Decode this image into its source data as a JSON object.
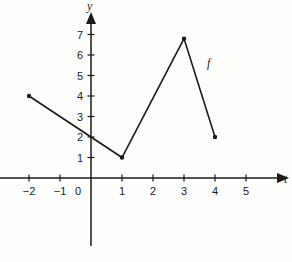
{
  "chart_data": {
    "type": "line",
    "title": "",
    "xlabel": "t",
    "ylabel": "y",
    "function_label": "f",
    "xlim": [
      -3,
      6
    ],
    "ylim": [
      -3.3,
      8
    ],
    "grid": false,
    "x_ticks": [
      -2,
      -1,
      0,
      1,
      2,
      3,
      4,
      5
    ],
    "x_tick_labels": [
      "−2",
      "−1",
      "0",
      "1",
      "2",
      "3",
      "4",
      "5"
    ],
    "y_ticks": [
      1,
      2,
      3,
      4,
      5,
      6,
      7
    ],
    "y_tick_labels": [
      "1",
      "2",
      "3",
      "4",
      "5",
      "6",
      "7"
    ],
    "series": [
      {
        "name": "f",
        "x": [
          -2,
          1,
          3,
          4
        ],
        "y": [
          4,
          1,
          6.8,
          2
        ],
        "endpoints_marked": true
      }
    ],
    "colors": {
      "line": "#1a1a1a",
      "axis": "#1a1a1a",
      "background": "#fdfdfc"
    }
  }
}
